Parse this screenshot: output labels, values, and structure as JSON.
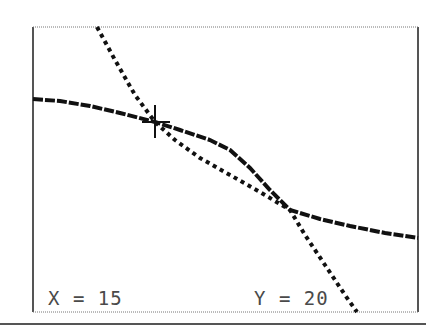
{
  "graph": {
    "title": "",
    "frame": {
      "left": 33,
      "top": 27,
      "right": 418,
      "bottom": 312
    },
    "cursor": {
      "x": 155,
      "y": 122,
      "symbol": "crosshair-cursor"
    },
    "readout": {
      "x_label": "X = 15",
      "y_label": "Y = 20"
    },
    "colors": {
      "plot": "#111111",
      "frame": "#555555",
      "text": "#4a4a4a",
      "background": "#ffffff"
    }
  },
  "chart_data": {
    "type": "line",
    "title": "",
    "xlabel": "",
    "ylabel": "",
    "grid": false,
    "cursor_point": {
      "x": 15,
      "y": 20
    },
    "series": [
      {
        "name": "curve-1 (S-shaped, dashed)",
        "style": "dashed",
        "pixel_points": [
          [
            33,
            99
          ],
          [
            60,
            101
          ],
          [
            90,
            106
          ],
          [
            120,
            113
          ],
          [
            155,
            122
          ],
          [
            180,
            130
          ],
          [
            210,
            140
          ],
          [
            230,
            150
          ],
          [
            250,
            168
          ],
          [
            270,
            190
          ],
          [
            290,
            210
          ],
          [
            320,
            219
          ],
          [
            350,
            226
          ],
          [
            385,
            233
          ],
          [
            418,
            238
          ]
        ]
      },
      {
        "name": "curve-2 (steep, dotted)",
        "style": "dotted",
        "pixel_points": [
          [
            97,
            27
          ],
          [
            115,
            60
          ],
          [
            135,
            95
          ],
          [
            155,
            122
          ],
          [
            175,
            140
          ],
          [
            200,
            158
          ],
          [
            230,
            175
          ],
          [
            260,
            192
          ],
          [
            290,
            210
          ],
          [
            305,
            235
          ],
          [
            325,
            265
          ],
          [
            345,
            295
          ],
          [
            357,
            312
          ]
        ]
      }
    ]
  }
}
